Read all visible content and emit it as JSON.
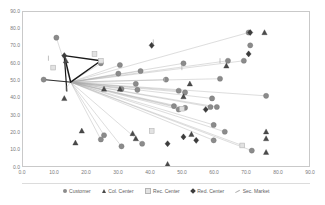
{
  "chart_data": {
    "type": "scatter",
    "title": "",
    "subtitle": "",
    "xlabel": "",
    "ylabel": "",
    "xlim": [
      0,
      90
    ],
    "ylim": [
      0,
      90
    ],
    "xticks": [
      "0.0",
      "10.0",
      "20.0",
      "30.0",
      "40.0",
      "50.0",
      "60.0",
      "70.0",
      "80.0",
      "90.0"
    ],
    "yticks": [
      "0.0",
      "10.0",
      "20.0",
      "30.0",
      "40.0",
      "50.0",
      "60.0",
      "70.0",
      "80.0",
      "90.0"
    ],
    "xtick_values": [
      0,
      10,
      20,
      30,
      40,
      50,
      60,
      70,
      80,
      90
    ],
    "ytick_values": [
      0,
      10,
      20,
      30,
      40,
      50,
      60,
      70,
      80,
      90
    ],
    "grid": false,
    "legend_position": "bottom",
    "hub": {
      "x": 15,
      "y": 49
    },
    "series": [
      {
        "name": "Customer",
        "marker": "circle",
        "color": "#8b8b8b",
        "points": [
          {
            "x": 10.5,
            "y": 75.0
          },
          {
            "x": 6.5,
            "y": 50.5
          },
          {
            "x": 24.5,
            "y": 60.0
          },
          {
            "x": 30.5,
            "y": 59.0
          },
          {
            "x": 30.0,
            "y": 54.0
          },
          {
            "x": 37.0,
            "y": 55.5
          },
          {
            "x": 35.5,
            "y": 48.0
          },
          {
            "x": 45.0,
            "y": 50.5
          },
          {
            "x": 50.5,
            "y": 60.0
          },
          {
            "x": 62.0,
            "y": 51.0
          },
          {
            "x": 64.5,
            "y": 61.5
          },
          {
            "x": 69.5,
            "y": 61.5
          },
          {
            "x": 71.0,
            "y": 78.0
          },
          {
            "x": 71.5,
            "y": 70.5
          },
          {
            "x": 76.5,
            "y": 41.0
          },
          {
            "x": 59.5,
            "y": 39.5
          },
          {
            "x": 49.0,
            "y": 44.0
          },
          {
            "x": 51.0,
            "y": 43.0
          },
          {
            "x": 31.0,
            "y": 45.0
          },
          {
            "x": 36.0,
            "y": 44.5
          },
          {
            "x": 47.5,
            "y": 35.0
          },
          {
            "x": 49.0,
            "y": 33.0
          },
          {
            "x": 51.0,
            "y": 34.0
          },
          {
            "x": 59.0,
            "y": 34.5
          },
          {
            "x": 61.0,
            "y": 34.5
          },
          {
            "x": 60.0,
            "y": 24.0
          },
          {
            "x": 63.5,
            "y": 20.0
          },
          {
            "x": 60.0,
            "y": 15.0
          },
          {
            "x": 72.0,
            "y": 9.0
          },
          {
            "x": 25.5,
            "y": 18.0
          },
          {
            "x": 24.5,
            "y": 15.5
          },
          {
            "x": 31.0,
            "y": 11.5
          },
          {
            "x": 37.5,
            "y": 13.0
          }
        ]
      },
      {
        "name": "Col. Center",
        "marker": "triangle",
        "color": "#4a4a4a",
        "points": [
          {
            "x": 13.5,
            "y": 61.5
          },
          {
            "x": 13.0,
            "y": 39.5
          },
          {
            "x": 18.5,
            "y": 20.5
          },
          {
            "x": 16.5,
            "y": 13.5
          },
          {
            "x": 25.5,
            "y": 45.0
          },
          {
            "x": 30.5,
            "y": 45.0
          },
          {
            "x": 34.5,
            "y": 19.0
          },
          {
            "x": 35.5,
            "y": 16.0
          },
          {
            "x": 45.5,
            "y": 1.0
          },
          {
            "x": 52.5,
            "y": 48.0
          },
          {
            "x": 50.5,
            "y": 40.5
          },
          {
            "x": 53.0,
            "y": 18.5
          },
          {
            "x": 64.0,
            "y": 58.5
          },
          {
            "x": 76.0,
            "y": 78.0
          },
          {
            "x": 76.5,
            "y": 20.0
          },
          {
            "x": 76.5,
            "y": 16.0
          },
          {
            "x": 76.5,
            "y": 8.0
          }
        ]
      },
      {
        "name": "Rec. Center",
        "marker": "square",
        "color": "#e2e2e2",
        "points": [
          {
            "x": 9.5,
            "y": 57.5
          },
          {
            "x": 22.5,
            "y": 65.5
          },
          {
            "x": 24.5,
            "y": 61.5
          },
          {
            "x": 40.5,
            "y": 20.5
          },
          {
            "x": 50.0,
            "y": 33.5
          },
          {
            "x": 69.0,
            "y": 12.0
          }
        ]
      },
      {
        "name": "Red. Center",
        "marker": "diamond",
        "color": "#3c3c3c",
        "points": [
          {
            "x": 13.0,
            "y": 64.5
          },
          {
            "x": 40.5,
            "y": 70.5
          },
          {
            "x": 45.5,
            "y": 13.0
          },
          {
            "x": 50.5,
            "y": 17.0
          },
          {
            "x": 54.5,
            "y": 15.0
          },
          {
            "x": 57.5,
            "y": 33.0
          },
          {
            "x": 71.0,
            "y": 65.5
          },
          {
            "x": 71.5,
            "y": 78.0
          }
        ]
      },
      {
        "name": "Sec. Market",
        "marker": "tick",
        "color": "#b0b0b0",
        "points": [
          {
            "x": 8.0,
            "y": 63.0
          },
          {
            "x": 41.0,
            "y": 72.5
          },
          {
            "x": 44.5,
            "y": 50.5
          },
          {
            "x": 50.0,
            "y": 57.5
          },
          {
            "x": 62.0,
            "y": 61.5
          },
          {
            "x": 13.5,
            "y": 45.5
          }
        ]
      }
    ],
    "network_lines": {
      "description": "Radial connectors from central hub to customer nodes",
      "hub_color": "#a8a8a8",
      "spoke_targets": [
        {
          "x": 10.5,
          "y": 75.0
        },
        {
          "x": 6.5,
          "y": 50.5
        },
        {
          "x": 24.5,
          "y": 60.0
        },
        {
          "x": 30.5,
          "y": 59.0
        },
        {
          "x": 30.0,
          "y": 54.0
        },
        {
          "x": 37.0,
          "y": 55.5
        },
        {
          "x": 35.5,
          "y": 48.0
        },
        {
          "x": 45.0,
          "y": 50.5
        },
        {
          "x": 50.5,
          "y": 60.0
        },
        {
          "x": 62.0,
          "y": 51.0
        },
        {
          "x": 64.5,
          "y": 61.5
        },
        {
          "x": 69.5,
          "y": 61.5
        },
        {
          "x": 71.0,
          "y": 78.0
        },
        {
          "x": 76.5,
          "y": 41.0
        },
        {
          "x": 59.5,
          "y": 39.5
        },
        {
          "x": 49.0,
          "y": 44.0
        },
        {
          "x": 51.0,
          "y": 43.0
        },
        {
          "x": 31.0,
          "y": 45.0
        },
        {
          "x": 36.0,
          "y": 44.5
        },
        {
          "x": 47.5,
          "y": 35.0
        },
        {
          "x": 49.0,
          "y": 33.0
        },
        {
          "x": 51.0,
          "y": 34.0
        },
        {
          "x": 59.0,
          "y": 34.5
        },
        {
          "x": 61.0,
          "y": 34.5
        },
        {
          "x": 60.0,
          "y": 24.0
        },
        {
          "x": 63.5,
          "y": 20.0
        },
        {
          "x": 60.0,
          "y": 15.0
        },
        {
          "x": 72.0,
          "y": 9.0
        },
        {
          "x": 25.5,
          "y": 18.0
        },
        {
          "x": 24.5,
          "y": 15.5
        },
        {
          "x": 31.0,
          "y": 11.5
        },
        {
          "x": 37.5,
          "y": 13.0
        },
        {
          "x": 69.0,
          "y": 12.0
        },
        {
          "x": 50.0,
          "y": 33.5
        },
        {
          "x": 13.5,
          "y": 45.5
        }
      ],
      "backbone_color": "#1a1a1a",
      "backbone_path": [
        {
          "x": 13.0,
          "y": 64.5
        },
        {
          "x": 24.5,
          "y": 61.5
        },
        {
          "x": 15.0,
          "y": 49.0
        },
        {
          "x": 13.0,
          "y": 64.5
        }
      ],
      "backbone_stub": [
        {
          "x": 13.0,
          "y": 64.5
        },
        {
          "x": 13.8,
          "y": 43.5
        }
      ]
    }
  },
  "legend": {
    "entries": [
      {
        "label": "Customer"
      },
      {
        "label": "Col. Center"
      },
      {
        "label": "Rec. Center"
      },
      {
        "label": "Red. Center"
      },
      {
        "label": "Sec. Market"
      }
    ]
  }
}
